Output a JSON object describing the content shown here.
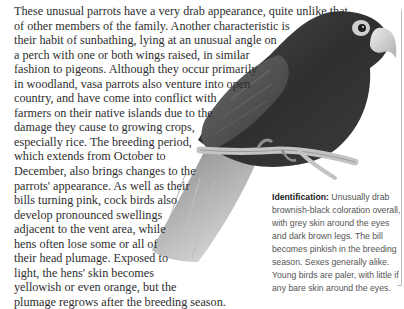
{
  "article": {
    "body_lines": [
      "These unusual parrots have a very drab appearance, quite unlike that",
      "of other members of the family. Another characteristic is",
      "their habit of sunbathing, lying at an unusual angle on",
      "a perch with one or both wings raised, in similar",
      "fashion to pigeons. Although they occur primarily",
      "in woodland, vasa parrots also venture into open",
      "country, and have come into conflict with",
      "farmers on their native islands due to the",
      "damage they cause to growing crops,",
      "especially rice. The breeding period,",
      "which extends from October to",
      "December, also brings changes to the",
      "parrots' appearance. As well as their",
      "bills turning pink, cock birds also",
      "develop pronounced swellings",
      "adjacent to the vent area, while",
      "hens often lose some or all of",
      "their head plumage. Exposed to",
      "light, the hens' skin becomes",
      "yellowish or even orange, but the",
      "plumage regrows after the breeding season."
    ]
  },
  "identification": {
    "lead": "Identification:",
    "lines": [
      " Unusually drab",
      "brownish-black coloration overall,",
      "with grey skin around the eyes",
      "and dark brown legs. The bill",
      "becomes pinkish in the breeding",
      "season. Sexes generally alike.",
      "Young birds are paler, with little if",
      "any bare skin around the eyes."
    ]
  },
  "illustration": {
    "subject": "vasa-parrot-on-branch",
    "colors": {
      "plumage_dark": "#3a3a3a",
      "plumage_mid": "#5a5a5a",
      "tail": "#9a9a9a",
      "beak": "#d8d8d8",
      "eye_ring": "#cfcfcf",
      "branch": "#c4c4c4"
    }
  }
}
